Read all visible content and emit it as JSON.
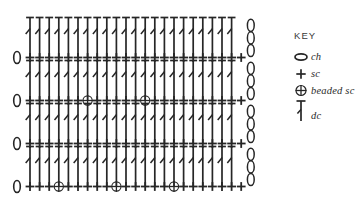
{
  "diagram": {
    "type": "crochet-symbol-chart",
    "ink_color": "#262626",
    "background": "#ffffff",
    "stitch_columns": 23,
    "turning_chain_count": 3,
    "rows": [
      {
        "index": 1,
        "row_type": "sc",
        "label": "bottom sc row",
        "start_symbol": "ch",
        "end_symbol": "sc",
        "stitches": [
          "sc",
          "sc",
          "sc",
          "beaded-sc",
          "sc",
          "sc",
          "sc",
          "sc",
          "sc",
          "beaded-sc",
          "sc",
          "sc",
          "sc",
          "sc",
          "sc",
          "beaded-sc",
          "sc",
          "sc",
          "sc"
        ],
        "beaded_positions": [
          4,
          10,
          16
        ]
      },
      {
        "index": 2,
        "row_type": "dc",
        "label": "dc row",
        "end_symbol": "ch-3",
        "stitch_count": 22
      },
      {
        "index": 3,
        "row_type": "sc",
        "label": "plain sc row",
        "start_symbol": "ch",
        "end_symbol": "sc",
        "stitches": [
          "sc",
          "sc",
          "sc",
          "sc",
          "sc",
          "sc",
          "sc",
          "sc",
          "sc",
          "sc",
          "sc",
          "sc",
          "sc",
          "sc",
          "sc",
          "sc",
          "sc",
          "sc",
          "sc",
          "sc",
          "sc",
          "sc"
        ],
        "beaded_positions": []
      },
      {
        "index": 4,
        "row_type": "dc",
        "label": "dc row",
        "end_symbol": "ch-3",
        "stitch_count": 22
      },
      {
        "index": 5,
        "row_type": "sc",
        "label": "beaded sc row",
        "start_symbol": "ch",
        "end_symbol": "sc",
        "stitches": [
          "sc",
          "sc",
          "sc",
          "sc",
          "sc",
          "sc",
          "beaded-sc",
          "sc",
          "sc",
          "sc",
          "sc",
          "sc",
          "beaded-sc",
          "sc",
          "sc",
          "sc",
          "sc",
          "sc",
          "sc"
        ],
        "beaded_positions": [
          7,
          13
        ]
      },
      {
        "index": 6,
        "row_type": "dc",
        "label": "dc row",
        "end_symbol": "ch-3",
        "stitch_count": 22
      },
      {
        "index": 7,
        "row_type": "sc",
        "label": "plain sc row",
        "start_symbol": "ch",
        "end_symbol": "sc",
        "stitches": [
          "sc",
          "sc",
          "sc",
          "sc",
          "sc",
          "sc",
          "sc",
          "sc",
          "sc",
          "sc",
          "sc",
          "sc",
          "sc",
          "sc",
          "sc",
          "sc",
          "sc",
          "sc",
          "sc",
          "sc",
          "sc",
          "sc"
        ],
        "beaded_positions": []
      },
      {
        "index": 8,
        "row_type": "dc",
        "label": "top dc row",
        "end_symbol": "ch-3",
        "stitch_count": 22
      }
    ]
  },
  "key": {
    "title": "KEY",
    "entries": [
      {
        "symbol": "ch-oval-icon",
        "label": "ch"
      },
      {
        "symbol": "sc-plus-icon",
        "label": "sc"
      },
      {
        "symbol": "beaded-sc-circled-plus-icon",
        "label": "beaded sc"
      },
      {
        "symbol": "dc-bar-icon",
        "label": "dc"
      }
    ]
  }
}
